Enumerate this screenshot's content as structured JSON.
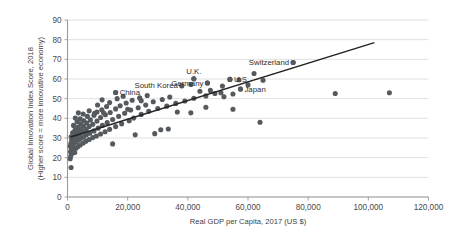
{
  "chart_data": {
    "type": "scatter",
    "title": "",
    "xlabel": "Real GDP per Capita, 2017 (US $)",
    "ylabel_line1": "Global Innovation Index Score, 2018",
    "ylabel_line2": "(Higher score = more innovative economy)",
    "xlim": [
      0,
      120000
    ],
    "ylim": [
      0,
      90
    ],
    "xticks": [
      0,
      20000,
      40000,
      60000,
      80000,
      100000,
      120000
    ],
    "xticklabels": [
      "0",
      "20,000",
      "40,000",
      "60,000",
      "80,000",
      "100,000",
      "120,000"
    ],
    "yticks": [
      0,
      10,
      20,
      30,
      40,
      50,
      60,
      70,
      80,
      90
    ],
    "yticklabels": [
      "0",
      "10",
      "20",
      "30",
      "40",
      "50",
      "60",
      "70",
      "80",
      "90"
    ],
    "grid": "horizontal",
    "legend": "none",
    "dot_color": "#555a5e",
    "trendline_color": "#232323",
    "gridline_color": "#d8d8d8",
    "trendline": {
      "x0": 1000,
      "y0": 30.5,
      "x1": 102000,
      "y1": 78.5
    },
    "annotations": [
      {
        "label": "South Korea",
        "x": 38000,
        "y": 56.6,
        "anchor": "end",
        "dx": -4,
        "dy": 2.6
      },
      {
        "label": "China",
        "x": 16000,
        "y": 53.1,
        "anchor": "start",
        "dx": 4,
        "dy": 2.6
      },
      {
        "label": "U.K.",
        "x": 42000,
        "y": 60.1,
        "anchor": "middle",
        "dx": 0,
        "dy": -5
      },
      {
        "label": "Germany",
        "x": 46500,
        "y": 58.0,
        "anchor": "end",
        "dx": -4,
        "dy": 2.6
      },
      {
        "label": "U.S.",
        "x": 54000,
        "y": 59.8,
        "anchor": "start",
        "dx": 4,
        "dy": 2.6
      },
      {
        "label": "Japan",
        "x": 57500,
        "y": 54.9,
        "anchor": "start",
        "dx": 4,
        "dy": 2.6
      },
      {
        "label": "Switzerland",
        "x": 75000,
        "y": 68.4,
        "anchor": "end",
        "dx": -4,
        "dy": 2.6
      }
    ],
    "points": [
      {
        "x": 1200,
        "y": 15.0
      },
      {
        "x": 900,
        "y": 19.5
      },
      {
        "x": 1100,
        "y": 21.0
      },
      {
        "x": 1500,
        "y": 22.2
      },
      {
        "x": 1000,
        "y": 23.0
      },
      {
        "x": 1800,
        "y": 23.6
      },
      {
        "x": 2400,
        "y": 22.6
      },
      {
        "x": 1300,
        "y": 24.4
      },
      {
        "x": 2100,
        "y": 25.0
      },
      {
        "x": 900,
        "y": 25.8
      },
      {
        "x": 2800,
        "y": 24.8
      },
      {
        "x": 1600,
        "y": 26.4
      },
      {
        "x": 3400,
        "y": 25.6
      },
      {
        "x": 1100,
        "y": 27.2
      },
      {
        "x": 2300,
        "y": 27.6
      },
      {
        "x": 4200,
        "y": 26.4
      },
      {
        "x": 3000,
        "y": 28.2
      },
      {
        "x": 1400,
        "y": 28.8
      },
      {
        "x": 5200,
        "y": 27.4
      },
      {
        "x": 2000,
        "y": 29.4
      },
      {
        "x": 3800,
        "y": 29.0
      },
      {
        "x": 6100,
        "y": 28.4
      },
      {
        "x": 2600,
        "y": 30.2
      },
      {
        "x": 4600,
        "y": 30.0
      },
      {
        "x": 1200,
        "y": 30.6
      },
      {
        "x": 7200,
        "y": 29.2
      },
      {
        "x": 3200,
        "y": 31.0
      },
      {
        "x": 5400,
        "y": 30.8
      },
      {
        "x": 2200,
        "y": 31.8
      },
      {
        "x": 8400,
        "y": 30.2
      },
      {
        "x": 4000,
        "y": 32.2
      },
      {
        "x": 6300,
        "y": 31.6
      },
      {
        "x": 1700,
        "y": 32.6
      },
      {
        "x": 9600,
        "y": 31.0
      },
      {
        "x": 3000,
        "y": 33.2
      },
      {
        "x": 5000,
        "y": 33.4
      },
      {
        "x": 7400,
        "y": 32.4
      },
      {
        "x": 2500,
        "y": 34.0
      },
      {
        "x": 11000,
        "y": 32.0
      },
      {
        "x": 4200,
        "y": 34.6
      },
      {
        "x": 6200,
        "y": 34.4
      },
      {
        "x": 8800,
        "y": 33.6
      },
      {
        "x": 3400,
        "y": 35.4
      },
      {
        "x": 12500,
        "y": 33.2
      },
      {
        "x": 5300,
        "y": 36.0
      },
      {
        "x": 7200,
        "y": 35.8
      },
      {
        "x": 2000,
        "y": 36.4
      },
      {
        "x": 10200,
        "y": 35.0
      },
      {
        "x": 4400,
        "y": 37.2
      },
      {
        "x": 14000,
        "y": 34.4
      },
      {
        "x": 6400,
        "y": 37.6
      },
      {
        "x": 8400,
        "y": 37.0
      },
      {
        "x": 3200,
        "y": 38.2
      },
      {
        "x": 11600,
        "y": 36.4
      },
      {
        "x": 5400,
        "y": 38.8
      },
      {
        "x": 16000,
        "y": 35.8
      },
      {
        "x": 7600,
        "y": 39.2
      },
      {
        "x": 9800,
        "y": 38.6
      },
      {
        "x": 4200,
        "y": 39.8
      },
      {
        "x": 13200,
        "y": 37.8
      },
      {
        "x": 2600,
        "y": 40.2
      },
      {
        "x": 6600,
        "y": 41.0
      },
      {
        "x": 18000,
        "y": 37.2
      },
      {
        "x": 11000,
        "y": 40.4
      },
      {
        "x": 8800,
        "y": 41.6
      },
      {
        "x": 5200,
        "y": 42.2
      },
      {
        "x": 15000,
        "y": 39.4
      },
      {
        "x": 3600,
        "y": 42.8
      },
      {
        "x": 12600,
        "y": 41.8
      },
      {
        "x": 20500,
        "y": 38.8
      },
      {
        "x": 9800,
        "y": 43.2
      },
      {
        "x": 17000,
        "y": 41.0
      },
      {
        "x": 7200,
        "y": 43.8
      },
      {
        "x": 14200,
        "y": 43.0
      },
      {
        "x": 22000,
        "y": 40.2
      },
      {
        "x": 11400,
        "y": 44.4
      },
      {
        "x": 19000,
        "y": 42.6
      },
      {
        "x": 16000,
        "y": 44.8
      },
      {
        "x": 24500,
        "y": 42.0
      },
      {
        "x": 13000,
        "y": 46.0
      },
      {
        "x": 21000,
        "y": 44.2
      },
      {
        "x": 27000,
        "y": 43.6
      },
      {
        "x": 17500,
        "y": 46.4
      },
      {
        "x": 10000,
        "y": 46.8
      },
      {
        "x": 23500,
        "y": 45.4
      },
      {
        "x": 30000,
        "y": 45.0
      },
      {
        "x": 19500,
        "y": 47.8
      },
      {
        "x": 14000,
        "y": 48.0
      },
      {
        "x": 26000,
        "y": 46.8
      },
      {
        "x": 33000,
        "y": 46.2
      },
      {
        "x": 21500,
        "y": 49.2
      },
      {
        "x": 11500,
        "y": 49.4
      },
      {
        "x": 28500,
        "y": 48.4
      },
      {
        "x": 36000,
        "y": 47.6
      },
      {
        "x": 24000,
        "y": 50.4
      },
      {
        "x": 16500,
        "y": 50.0
      },
      {
        "x": 31500,
        "y": 49.6
      },
      {
        "x": 39000,
        "y": 48.8
      },
      {
        "x": 26500,
        "y": 51.6
      },
      {
        "x": 18500,
        "y": 51.2
      },
      {
        "x": 34000,
        "y": 50.8
      },
      {
        "x": 42000,
        "y": 50.2
      },
      {
        "x": 46000,
        "y": 51.4
      },
      {
        "x": 49000,
        "y": 52.6
      },
      {
        "x": 52000,
        "y": 51.0
      },
      {
        "x": 44000,
        "y": 53.8
      },
      {
        "x": 47500,
        "y": 54.2
      },
      {
        "x": 51000,
        "y": 53.0
      },
      {
        "x": 55000,
        "y": 52.4
      },
      {
        "x": 57500,
        "y": 54.9
      },
      {
        "x": 38000,
        "y": 56.6
      },
      {
        "x": 16000,
        "y": 53.1
      },
      {
        "x": 41000,
        "y": 57.2
      },
      {
        "x": 46500,
        "y": 58.0
      },
      {
        "x": 42000,
        "y": 60.1
      },
      {
        "x": 54000,
        "y": 59.8
      },
      {
        "x": 57000,
        "y": 59.6
      },
      {
        "x": 51500,
        "y": 56.4
      },
      {
        "x": 60000,
        "y": 57.0
      },
      {
        "x": 62000,
        "y": 62.8
      },
      {
        "x": 65000,
        "y": 59.4
      },
      {
        "x": 75000,
        "y": 68.4
      },
      {
        "x": 41000,
        "y": 42.8
      },
      {
        "x": 22500,
        "y": 31.6
      },
      {
        "x": 29000,
        "y": 32.2
      },
      {
        "x": 31000,
        "y": 34.2
      },
      {
        "x": 15000,
        "y": 27.0
      },
      {
        "x": 33500,
        "y": 34.6
      },
      {
        "x": 55000,
        "y": 44.6
      },
      {
        "x": 64000,
        "y": 38.0
      },
      {
        "x": 89000,
        "y": 52.6
      },
      {
        "x": 107000,
        "y": 53.0
      },
      {
        "x": 46000,
        "y": 45.6
      },
      {
        "x": 36500,
        "y": 43.2
      },
      {
        "x": 20000,
        "y": 44.6
      },
      {
        "x": 24500,
        "y": 49.0
      },
      {
        "x": 9000,
        "y": 42.6
      },
      {
        "x": 12000,
        "y": 42.8
      }
    ]
  }
}
